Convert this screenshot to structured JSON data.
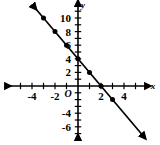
{
  "chart_data": {
    "type": "line",
    "title": "",
    "xlabel": "x",
    "ylabel": "y",
    "xlim": [
      -5.6,
      5.6
    ],
    "ylim": [
      -8.2,
      11.8
    ],
    "grid": false,
    "legend": null,
    "line": {
      "label": "y = -2x + 4",
      "slope": -2,
      "intercept": 4,
      "color": "#000000",
      "arrow_both_ends": true
    },
    "points": [
      {
        "x": -3,
        "y": 10
      },
      {
        "x": -2,
        "y": 8
      },
      {
        "x": -1,
        "y": 6
      },
      {
        "x": 0,
        "y": 4
      },
      {
        "x": 1,
        "y": 2
      },
      {
        "x": 2,
        "y": 0
      },
      {
        "x": 3,
        "y": -2
      }
    ],
    "x_tick_values": [
      -5,
      -4,
      -3,
      -2,
      -1,
      1,
      2,
      3,
      4,
      5
    ],
    "y_tick_values": [
      -7,
      -6,
      -5,
      -4,
      -3,
      -2,
      -1,
      1,
      2,
      3,
      4,
      5,
      6,
      7,
      8,
      9,
      10,
      11
    ],
    "x_tick_labels": [
      {
        "value": -4,
        "text": "-4"
      },
      {
        "value": -2,
        "text": "-2"
      },
      {
        "value": 2,
        "text": "2"
      },
      {
        "value": 4,
        "text": "4"
      }
    ],
    "y_tick_labels": [
      {
        "value": 10,
        "text": "10"
      },
      {
        "value": 8,
        "text": "8"
      },
      {
        "value": 6,
        "text": "6"
      },
      {
        "value": 4,
        "text": "4"
      },
      {
        "value": 2,
        "text": "2"
      },
      {
        "value": -4,
        "text": "-4"
      },
      {
        "value": -6,
        "text": "-6"
      }
    ],
    "origin_label": "O",
    "x_axis_name": "x",
    "y_axis_name": "y"
  },
  "figure": {
    "background_color": "#ffffff",
    "axis_color": "#000000",
    "point_color": "#000000"
  }
}
